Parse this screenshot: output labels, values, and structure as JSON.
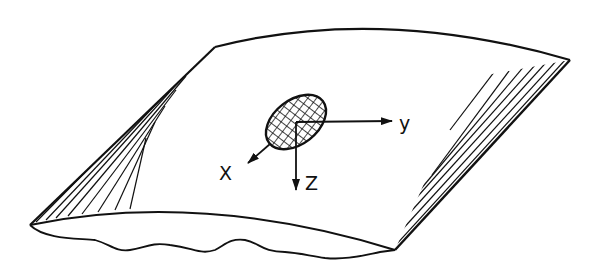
{
  "diagram": {
    "axes": [
      {
        "id": "x",
        "label": "X"
      },
      {
        "id": "y",
        "label": "y"
      },
      {
        "id": "z",
        "label": "Z"
      }
    ],
    "colors": {
      "stroke": "#111111",
      "background": "#ffffff"
    }
  }
}
